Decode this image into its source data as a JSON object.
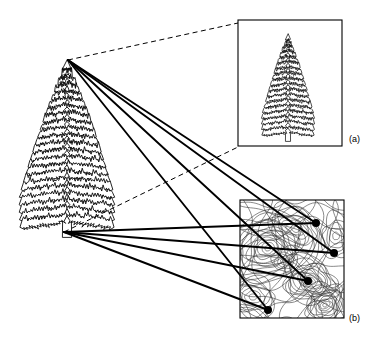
{
  "figure": {
    "title_visible": false,
    "background_color": "#ffffff",
    "ink_color": "#000000",
    "width": 375,
    "height": 349
  },
  "panels": [
    {
      "id": "panel-a",
      "label": "(a)",
      "label_position": {
        "x": 349,
        "y": 134
      },
      "box": {
        "x": 238,
        "y": 20,
        "width": 104,
        "height": 126
      },
      "content": "tree-silhouette-outline",
      "description_visible": false
    },
    {
      "id": "panel-b",
      "label": "(b)",
      "label_position": {
        "x": 349,
        "y": 313
      },
      "box": {
        "x": 240,
        "y": 200,
        "width": 104,
        "height": 118
      },
      "content": "contour-map",
      "description_visible": false
    }
  ],
  "main_subject": {
    "name": "conifer-tree-outline",
    "apex_point": {
      "x": 68,
      "y": 60
    },
    "base_point": {
      "x": 64,
      "y": 232
    },
    "trunk_bottom": {
      "x": 66,
      "y": 236
    }
  },
  "dashed_connectors": [
    {
      "from": {
        "x": 68,
        "y": 60
      },
      "to": {
        "x": 238,
        "y": 23
      }
    },
    {
      "from": {
        "x": 64,
        "y": 232
      },
      "to": {
        "x": 238,
        "y": 147
      }
    }
  ],
  "markers": [
    {
      "id": "marker-1",
      "x": 316,
      "y": 223,
      "radius": 4
    },
    {
      "id": "marker-2",
      "x": 334,
      "y": 253,
      "radius": 4
    },
    {
      "id": "marker-3",
      "x": 308,
      "y": 281,
      "radius": 4
    },
    {
      "id": "marker-4",
      "x": 268,
      "y": 310,
      "radius": 4
    }
  ],
  "solid_rays_from_apex": [
    {
      "from": {
        "x": 68,
        "y": 60
      },
      "to": {
        "x": 316,
        "y": 223
      }
    },
    {
      "from": {
        "x": 68,
        "y": 60
      },
      "to": {
        "x": 334,
        "y": 253
      }
    },
    {
      "from": {
        "x": 68,
        "y": 60
      },
      "to": {
        "x": 308,
        "y": 281
      }
    },
    {
      "from": {
        "x": 68,
        "y": 60
      },
      "to": {
        "x": 268,
        "y": 310
      }
    }
  ],
  "solid_rays_from_base": [
    {
      "from": {
        "x": 64,
        "y": 232
      },
      "to": {
        "x": 316,
        "y": 223
      }
    },
    {
      "from": {
        "x": 64,
        "y": 232
      },
      "to": {
        "x": 334,
        "y": 253
      }
    },
    {
      "from": {
        "x": 64,
        "y": 232
      },
      "to": {
        "x": 308,
        "y": 281
      }
    },
    {
      "from": {
        "x": 64,
        "y": 232
      },
      "to": {
        "x": 268,
        "y": 310
      }
    }
  ],
  "contour_map": {
    "line_color": "#2a2a2a",
    "line_width": 0.55,
    "peaks": [
      {
        "cx": 268,
        "cy": 248,
        "rings": 13,
        "rx": 30,
        "ry": 24,
        "rot": -22
      },
      {
        "cx": 310,
        "cy": 281,
        "rings": 11,
        "rx": 19,
        "ry": 15,
        "rot": 18
      },
      {
        "cx": 325,
        "cy": 305,
        "rings": 9,
        "rx": 15,
        "ry": 11,
        "rot": -34
      },
      {
        "cx": 295,
        "cy": 229,
        "rings": 7,
        "rx": 22,
        "ry": 13,
        "rot": 30
      },
      {
        "cx": 253,
        "cy": 297,
        "rings": 6,
        "rx": 17,
        "ry": 12,
        "rot": 10
      },
      {
        "cx": 336,
        "cy": 236,
        "rings": 5,
        "rx": 11,
        "ry": 14,
        "rot": -10
      },
      {
        "cx": 283,
        "cy": 262,
        "rings": 4,
        "rx": 8,
        "ry": 6,
        "rot": 40
      }
    ]
  }
}
